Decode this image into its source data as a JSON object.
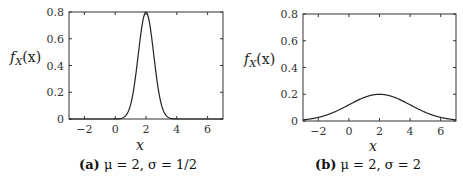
{
  "chart_data": [
    {
      "type": "line",
      "panel": "a",
      "caption_label": "(a)",
      "caption_text": "μ = 2, σ = 1/2",
      "title": "",
      "xlabel": "x",
      "ylabel": "f_X(x)",
      "ylabel_display": "fX(x)",
      "xlim": [
        -3,
        7
      ],
      "ylim": [
        0,
        0.8
      ],
      "xticks": [
        -2,
        0,
        2,
        4,
        6
      ],
      "xtick_labels": [
        "−2",
        "0",
        "2",
        "4",
        "6"
      ],
      "yticks": [
        0,
        0.2,
        0.4,
        0.6,
        0.8
      ],
      "ytick_labels": [
        "0",
        "0.2",
        "0.4",
        "0.6",
        "0.8"
      ],
      "grid": false,
      "legend": null,
      "series": [
        {
          "name": "Normal pdf",
          "mu": 2,
          "sigma": 0.5,
          "x": [
            -3,
            -2,
            -1,
            0,
            0.5,
            1,
            1.5,
            2,
            2.5,
            3,
            3.5,
            4,
            5,
            6,
            7
          ],
          "y": [
            0,
            0,
            0,
            0.0003,
            0.0089,
            0.108,
            0.484,
            0.798,
            0.484,
            0.108,
            0.0089,
            0.0003,
            0,
            0,
            0
          ]
        }
      ]
    },
    {
      "type": "line",
      "panel": "b",
      "caption_label": "(b)",
      "caption_text": "μ = 2, σ = 2",
      "title": "",
      "xlabel": "x",
      "ylabel": "f_X(x)",
      "ylabel_display": "fX(x)",
      "xlim": [
        -3,
        7
      ],
      "ylim": [
        0,
        0.8
      ],
      "xticks": [
        -2,
        0,
        2,
        4,
        6
      ],
      "xtick_labels": [
        "−2",
        "0",
        "2",
        "4",
        "6"
      ],
      "yticks": [
        0,
        0.2,
        0.4,
        0.6,
        0.8
      ],
      "ytick_labels": [
        "0",
        "0.2",
        "0.4",
        "0.6",
        "0.8"
      ],
      "grid": false,
      "legend": null,
      "series": [
        {
          "name": "Normal pdf",
          "mu": 2,
          "sigma": 2,
          "x": [
            -3,
            -2,
            -1,
            0,
            1,
            2,
            3,
            4,
            5,
            6,
            7
          ],
          "y": [
            0.0088,
            0.027,
            0.065,
            0.121,
            0.176,
            0.199,
            0.176,
            0.121,
            0.065,
            0.027,
            0.0088
          ]
        }
      ]
    }
  ],
  "panels": {
    "a": {
      "label": "(a)",
      "caption": " μ = 2, σ = 1/2",
      "xlabel": "x",
      "ylabel_f": "f",
      "ylabel_sub": "X",
      "ylabel_arg": "(x)"
    },
    "b": {
      "label": "(b)",
      "caption": " μ = 2, σ = 2",
      "xlabel": "x",
      "ylabel_f": "f",
      "ylabel_sub": "X",
      "ylabel_arg": "(x)"
    }
  },
  "ticks": {
    "x": [
      "−2",
      "0",
      "2",
      "4",
      "6"
    ],
    "y": [
      "0",
      "0.2",
      "0.4",
      "0.6",
      "0.8"
    ]
  }
}
